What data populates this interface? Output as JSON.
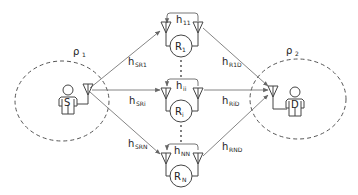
{
  "diagram": {
    "source": {
      "label": "S",
      "region_label": "ρ",
      "region_sub": "1"
    },
    "destination": {
      "label": "D",
      "region_label": "ρ",
      "region_sub": "2"
    },
    "relays": [
      {
        "label": "R",
        "sub": "1",
        "loop_label": "h",
        "loop_sub": "11",
        "in_label": "h",
        "in_sub": "SR1",
        "out_label": "h",
        "out_sub": "R1D"
      },
      {
        "label": "R",
        "sub": "i",
        "loop_label": "h",
        "loop_sub": "ii",
        "in_label": "h",
        "in_sub": "SRi",
        "out_label": "h",
        "out_sub": "RiD"
      },
      {
        "label": "R",
        "sub": "N",
        "loop_label": "h",
        "loop_sub": "NN",
        "in_label": "h",
        "in_sub": "SRN",
        "out_label": "h",
        "out_sub": "RND"
      }
    ],
    "ellipsis": "⋮",
    "colors": {
      "line": "#555555",
      "arrow": "#777777",
      "dash": "#555555",
      "text": "#222222"
    }
  }
}
